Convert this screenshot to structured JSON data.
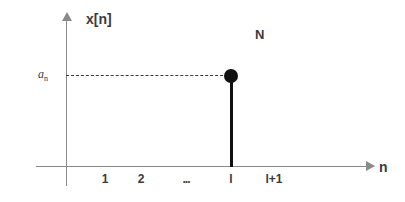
{
  "chart_data": {
    "type": "scatter",
    "title": "",
    "xlabel": "n",
    "ylabel": "x[n]",
    "xtick_labels": [
      "1",
      "2",
      "...",
      "l",
      "l+1"
    ],
    "ytick_labels": [
      "a"
    ],
    "ytick_subscript": "n",
    "categories": [
      "1",
      "2",
      "...",
      "l",
      "l+1"
    ],
    "values": [
      0,
      0,
      0,
      1,
      0
    ],
    "series": [
      {
        "name": "x[n]",
        "points": [
          {
            "x": "l",
            "y": "a_n"
          }
        ]
      }
    ],
    "annotations": [
      {
        "text": "N",
        "position": "upper-right"
      }
    ],
    "grid": false,
    "legend": false,
    "axis_arrows": true,
    "dashed_guide": {
      "from": "y-axis",
      "to": "stem-marker",
      "level": "a_n"
    },
    "colors": {
      "axis": "#8a8a8a",
      "stem": "#111111",
      "marker": "#111111",
      "dashed": "#3a3a3a",
      "text": "#3b3b3b",
      "background": "#ffffff"
    }
  },
  "figure": {
    "y_axis_label": "x[n]",
    "x_axis_label": "n",
    "annotation_label": "N",
    "amplitude_label": "a",
    "amplitude_subscript": "n",
    "tick_1": "1",
    "tick_2": "2",
    "tick_ellipsis": "...",
    "tick_l": "l",
    "tick_l_plus_1": "l+1",
    "icons": {
      "x_axis_arrow": "arrow-right-icon",
      "y_axis_arrow": "arrow-up-icon",
      "marker": "filled-circle-icon"
    }
  }
}
